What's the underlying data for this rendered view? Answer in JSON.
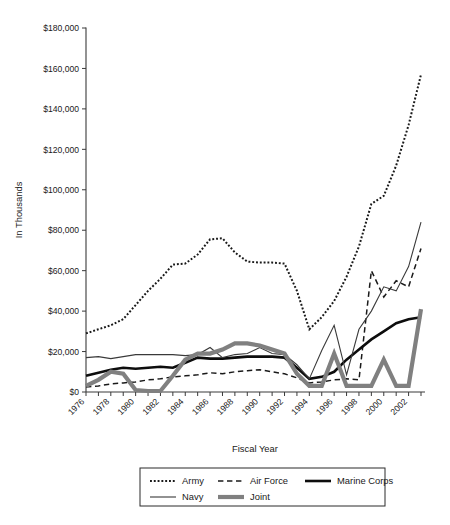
{
  "chart_data": {
    "type": "line",
    "title": "",
    "xlabel": "Fiscal Year",
    "ylabel": "In Thousands",
    "x": [
      1976,
      1977,
      1978,
      1979,
      1980,
      1981,
      1982,
      1983,
      1984,
      1985,
      1986,
      1987,
      1988,
      1989,
      1990,
      1991,
      1992,
      1993,
      1994,
      1995,
      1996,
      1997,
      1998,
      1999,
      2000,
      2001,
      2002,
      2003
    ],
    "xtick_labels": [
      "1976",
      "1978",
      "1980",
      "1982",
      "1984",
      "1986",
      "1988",
      "1990",
      "1992",
      "1994",
      "1996",
      "1998",
      "2000",
      "2002"
    ],
    "ytick_labels": [
      "$0",
      "$20,000",
      "$40,000",
      "$60,000",
      "$80,000",
      "$100,000",
      "$120,000",
      "$140,000",
      "$160,000",
      "$180,000"
    ],
    "ylim": [
      0,
      180000
    ],
    "xlim": [
      1976,
      2003
    ],
    "ytick_step": 20000,
    "grid": false,
    "legend_position": "bottom",
    "series": [
      {
        "name": "Army",
        "style": "dotted",
        "color": "#1a1a1a",
        "width": 2.0,
        "values": [
          29000,
          31000,
          33000,
          36000,
          43000,
          50000,
          56000,
          63000,
          63500,
          68000,
          75500,
          76000,
          69000,
          64500,
          64000,
          64000,
          63500,
          50000,
          31000,
          37000,
          45000,
          57000,
          72000,
          93000,
          97000,
          112000,
          132000,
          157000
        ]
      },
      {
        "name": "Air Force",
        "style": "dashed",
        "color": "#1a1a1a",
        "width": 1.5,
        "values": [
          2500,
          3000,
          4000,
          4500,
          5000,
          6000,
          6500,
          7500,
          8000,
          8500,
          9500,
          9000,
          10000,
          10500,
          11000,
          10000,
          9000,
          7000,
          4500,
          5000,
          6000,
          6500,
          6000,
          60000,
          47000,
          55000,
          52000,
          71000
        ]
      },
      {
        "name": "Marine Corps",
        "style": "solid",
        "color": "#0d0d0d",
        "width": 2.6,
        "values": [
          8000,
          9500,
          11000,
          12000,
          11500,
          12000,
          12500,
          12000,
          14500,
          17000,
          16500,
          16500,
          17000,
          17500,
          17500,
          17500,
          17000,
          12000,
          6500,
          7500,
          10000,
          16000,
          21000,
          26000,
          30000,
          34000,
          36000,
          37000
        ]
      },
      {
        "name": "Navy",
        "style": "solid",
        "color": "#3a3a3a",
        "width": 1.1,
        "values": [
          17000,
          17500,
          16500,
          17500,
          18500,
          18500,
          18500,
          18500,
          18000,
          18500,
          22000,
          17000,
          18500,
          19000,
          22000,
          19000,
          18500,
          13500,
          6500,
          20500,
          33000,
          8500,
          31000,
          40000,
          52000,
          50000,
          62000,
          84000
        ]
      },
      {
        "name": "Joint",
        "style": "solid",
        "color": "#808080",
        "width": 4.2,
        "values": [
          3000,
          6000,
          10000,
          9000,
          1000,
          500,
          500,
          8000,
          16000,
          19000,
          19000,
          21000,
          24000,
          24000,
          23000,
          21000,
          19000,
          9000,
          3000,
          3000,
          19000,
          3000,
          3000,
          3000,
          16000,
          3000,
          3000,
          41000
        ]
      }
    ]
  },
  "legend": {
    "entries": [
      {
        "label": "Army"
      },
      {
        "label": "Air Force"
      },
      {
        "label": "Marine Corps"
      },
      {
        "label": "Navy"
      },
      {
        "label": "Joint"
      }
    ]
  }
}
